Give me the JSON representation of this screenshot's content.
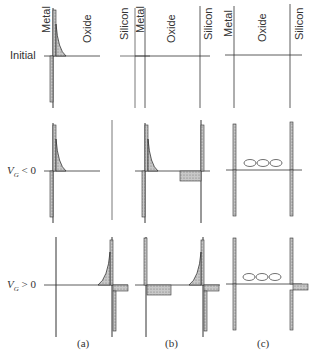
{
  "figure": {
    "column_headers": {
      "metal": "Metal",
      "oxide": "Oxide",
      "silicon": "Silicon"
    },
    "rows": [
      {
        "label": "Initial"
      },
      {
        "label_main": "V",
        "label_sub": "G",
        "label_rel": " < 0"
      },
      {
        "label_main": "V",
        "label_sub": "G",
        "label_rel": " > 0"
      }
    ],
    "columns": [
      {
        "caption": "(a)"
      },
      {
        "caption": "(b)"
      },
      {
        "caption": "(c)"
      }
    ],
    "dipole_symbol": "⊖⊕",
    "colors": {
      "line": "#333333",
      "hatch": "#bbbbbb",
      "background": "#ffffff"
    }
  }
}
